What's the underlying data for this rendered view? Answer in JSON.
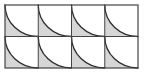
{
  "figure": {
    "canvas": {
      "width": 144,
      "height": 73,
      "background_color": "#ffffff"
    },
    "grid": {
      "columns": 4,
      "rows": 2,
      "origin_x": 5,
      "origin_y": 5,
      "cell_width": 33.25,
      "cell_height": 31.5,
      "total_width": 133,
      "total_height": 63
    },
    "style": {
      "shaded_fill": "#d6d6d6",
      "unshaded_fill": "#ffffff",
      "line_color": "#444444",
      "arc_color": "#2b2b2b",
      "border_width": 1.2,
      "grid_line_width": 1.0,
      "arc_width": 1.3
    },
    "tile": {
      "arc_center_corner": "top-right",
      "arc_start_corner": "top-left",
      "arc_end_corner": "bottom-right",
      "arc_sweep_degrees": 90,
      "shaded_region": "outside-quarter-disc",
      "shaded_region_corner": "bottom-left"
    },
    "cells": [
      {
        "row": 0,
        "col": 0,
        "name": "cell-r1c1",
        "shaded": true
      },
      {
        "row": 0,
        "col": 1,
        "name": "cell-r1c2",
        "shaded": true
      },
      {
        "row": 0,
        "col": 2,
        "name": "cell-r1c3",
        "shaded": true
      },
      {
        "row": 0,
        "col": 3,
        "name": "cell-r1c4",
        "shaded": true
      },
      {
        "row": 1,
        "col": 0,
        "name": "cell-r2c1",
        "shaded": true
      },
      {
        "row": 1,
        "col": 1,
        "name": "cell-r2c2",
        "shaded": true
      },
      {
        "row": 1,
        "col": 2,
        "name": "cell-r2c3",
        "shaded": true
      },
      {
        "row": 1,
        "col": 3,
        "name": "cell-r2c4",
        "shaded": true
      }
    ]
  }
}
